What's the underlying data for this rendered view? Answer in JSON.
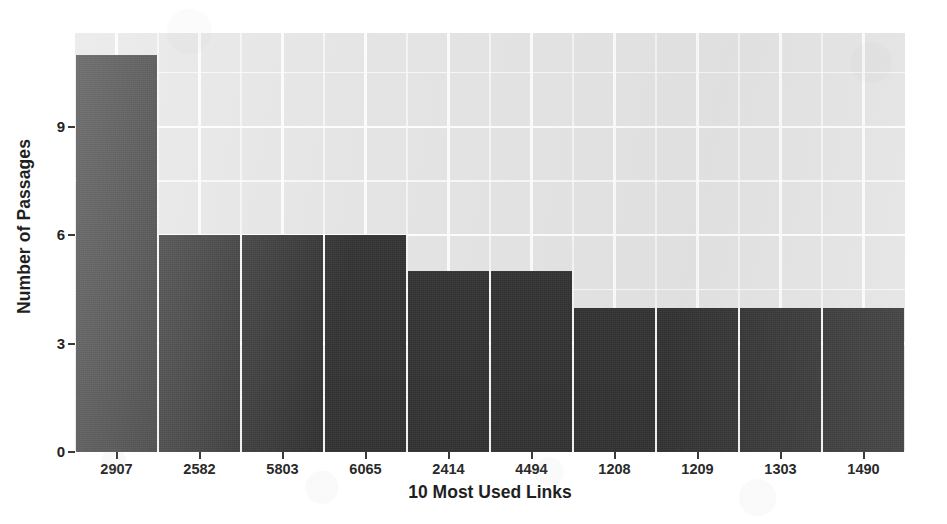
{
  "chart_data": {
    "type": "bar",
    "title": "",
    "subtitle": "",
    "xlabel": "10 Most Used Links",
    "ylabel": "Number of Passages",
    "categories": [
      "2907",
      "2582",
      "5803",
      "6065",
      "2414",
      "4494",
      "1208",
      "1209",
      "1303",
      "1490"
    ],
    "values": [
      11,
      6,
      6,
      6,
      5,
      5,
      4,
      4,
      4,
      4
    ],
    "ylim": [
      0,
      11.6
    ],
    "y_ticks": [
      0,
      3,
      6,
      9
    ],
    "y_tick_labels": [
      "0",
      "3",
      "6",
      "9"
    ],
    "y_minor_ticks": [
      1.5,
      4.5,
      7.5,
      10.5
    ],
    "grid": true,
    "grid_color": "#fdfdfd",
    "legend": "none",
    "bar_color": "#343434",
    "panel_color": "#e4e4e4",
    "series": [
      {
        "name": "Number of Passages",
        "values": [
          11,
          6,
          6,
          6,
          5,
          5,
          4,
          4,
          4,
          4
        ]
      }
    ]
  },
  "axes": {
    "y_title": "Number of Passages",
    "x_title": "10 Most Used Links"
  }
}
